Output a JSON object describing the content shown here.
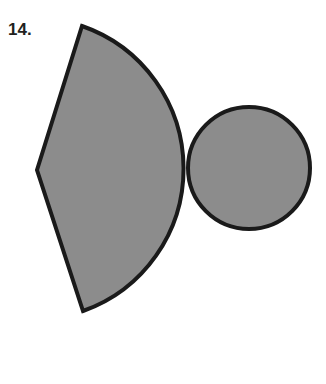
{
  "problem": {
    "number": "14."
  },
  "figure": {
    "fill": "#8c8c8c",
    "stroke": "#1a1a1a",
    "sector": {
      "apex": [
        37,
        170
      ],
      "top": [
        82,
        26
      ],
      "bottom": [
        83,
        311
      ]
    },
    "circle": {
      "cx": 249,
      "cy": 168,
      "r": 62
    }
  }
}
